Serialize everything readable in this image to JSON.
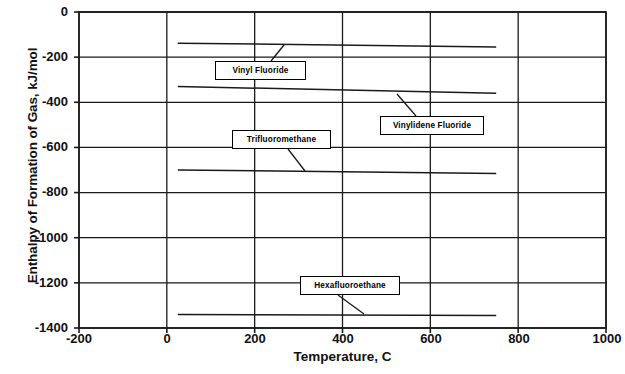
{
  "chart_data": {
    "type": "line",
    "title": "",
    "xlabel": "Temperature, C",
    "ylabel": "Enthalpy of Formation of Gas, kJ/mol",
    "xlim": [
      -200,
      1000
    ],
    "ylim": [
      -1400,
      0
    ],
    "xticks": [
      -200,
      0,
      200,
      400,
      600,
      800,
      1000
    ],
    "yticks": [
      0,
      -200,
      -400,
      -600,
      -800,
      -1000,
      -1200,
      -1400
    ],
    "xtick_labels": [
      "-200",
      "0",
      "200",
      "400",
      "600",
      "800",
      "1000"
    ],
    "ytick_labels": [
      "0",
      "-200",
      "-400",
      "-600",
      "-800",
      "-1000",
      "-1200",
      "-1400"
    ],
    "grid": true,
    "legend_position": "none",
    "line_color": "#1a1a1a",
    "series": [
      {
        "name": "Vinyl Fluoride",
        "x": [
          25,
          750
        ],
        "y": [
          -138,
          -155
        ]
      },
      {
        "name": "Vinylidene Fluoride",
        "x": [
          25,
          750
        ],
        "y": [
          -330,
          -360
        ]
      },
      {
        "name": "Trifluoromethane",
        "x": [
          25,
          750
        ],
        "y": [
          -700,
          -715
        ]
      },
      {
        "name": "Hexafluoroethane",
        "x": [
          25,
          750
        ],
        "y": [
          -1340,
          -1345
        ]
      }
    ],
    "annotations": [
      {
        "label": "Vinyl Fluoride",
        "points_to_series": "Vinyl Fluoride"
      },
      {
        "label": "Vinylidene Fluoride",
        "points_to_series": "Vinylidene Fluoride"
      },
      {
        "label": "Trifluoromethane",
        "points_to_series": "Trifluoromethane"
      },
      {
        "label": "Hexafluoroethane",
        "points_to_series": "Hexafluoroethane"
      }
    ]
  },
  "axes": {
    "x_title": "Temperature, C",
    "y_title": "Enthalpy of Formation of Gas, kJ/mol",
    "y_labels": {
      "t0": "0",
      "t1": "-200",
      "t2": "-400",
      "t3": "-600",
      "t4": "-800",
      "t5": "-1000",
      "t6": "-1200",
      "t7": "-1400"
    },
    "x_labels": {
      "t0": "-200",
      "t1": "0",
      "t2": "200",
      "t3": "400",
      "t4": "600",
      "t5": "800",
      "t6": "1000"
    }
  },
  "callouts": {
    "vinyl_fluoride": "Vinyl Fluoride",
    "vinylidene_fluoride": "Vinylidene Fluoride",
    "trifluoromethane": "Trifluoromethane",
    "hexafluoroethane": "Hexafluoroethane"
  }
}
